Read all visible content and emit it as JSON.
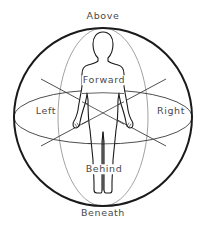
{
  "diagram": {
    "labels": {
      "above": "Above",
      "forward": "Forward",
      "left": "Left",
      "right": "Right",
      "behind": "Behind",
      "beneath": "Beneath"
    },
    "colors": {
      "background": "#ffffff",
      "sphere_outline": "#1a1a1a",
      "ellipse_lines": "#3a3a3a",
      "vertical_ellipse": "#7a7a7a",
      "figure_outline": "#1a1a1a",
      "label_text": "#4a4a4a"
    }
  }
}
